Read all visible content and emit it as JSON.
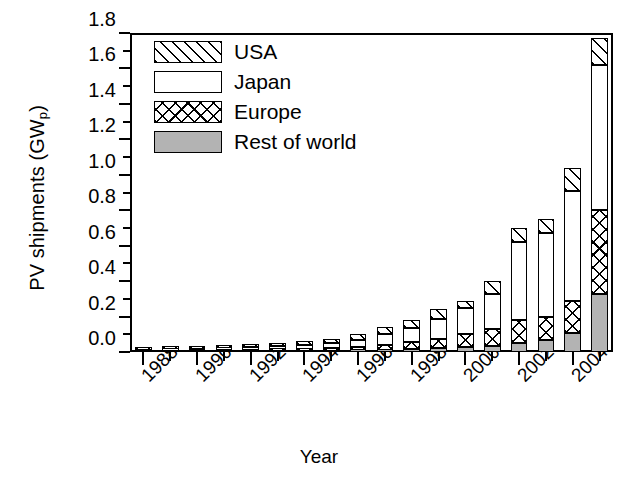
{
  "chart_data": {
    "type": "bar",
    "stacked": true,
    "title": "",
    "xlabel": "Year",
    "ylabel": "PV shipments (GW",
    "ylabel_sub": "p",
    "ylabel_suffix": ")",
    "ylim": [
      0.0,
      1.8
    ],
    "ytick_step": 0.2,
    "yticks": [
      "0.0",
      "0.2",
      "0.4",
      "0.6",
      "0.8",
      "1.0",
      "1.2",
      "1.4",
      "1.6",
      "1.8"
    ],
    "grid": false,
    "legend_position": "upper-left-inside",
    "categories": [
      "1988",
      "1989",
      "1990",
      "1991",
      "1992",
      "1993",
      "1994",
      "1995",
      "1996",
      "1997",
      "1998",
      "1999",
      "2000",
      "2001",
      "2002",
      "2003",
      "2004",
      "2005"
    ],
    "xtick_labels": [
      "1988",
      "1990",
      "1992",
      "1994",
      "1996",
      "1998",
      "2000",
      "2002",
      "2004"
    ],
    "xtick_label_indices": [
      0,
      2,
      4,
      6,
      8,
      10,
      12,
      14,
      16
    ],
    "series": [
      {
        "name": "Rest of world",
        "key": "row",
        "color": "#b3b3b3",
        "pattern": "solid-gray",
        "values": [
          0.002,
          0.003,
          0.004,
          0.004,
          0.005,
          0.006,
          0.007,
          0.008,
          0.01,
          0.013,
          0.016,
          0.02,
          0.027,
          0.035,
          0.05,
          0.07,
          0.11,
          0.33
        ]
      },
      {
        "name": "Europe",
        "key": "europe",
        "color": "#ffffff",
        "pattern": "cross-hatch",
        "values": [
          0.004,
          0.005,
          0.006,
          0.007,
          0.008,
          0.01,
          0.012,
          0.015,
          0.02,
          0.028,
          0.04,
          0.055,
          0.075,
          0.095,
          0.13,
          0.13,
          0.18,
          0.47
        ]
      },
      {
        "name": "Japan",
        "key": "japan",
        "color": "#ffffff",
        "pattern": "solid-white",
        "values": [
          0.006,
          0.007,
          0.009,
          0.011,
          0.013,
          0.016,
          0.021,
          0.027,
          0.04,
          0.06,
          0.08,
          0.11,
          0.145,
          0.2,
          0.44,
          0.47,
          0.62,
          0.82
        ]
      },
      {
        "name": "USA",
        "key": "usa",
        "color": "#ffffff",
        "pattern": "diagonal-hatch",
        "values": [
          0.008,
          0.01,
          0.011,
          0.013,
          0.014,
          0.018,
          0.02,
          0.025,
          0.03,
          0.039,
          0.044,
          0.055,
          0.043,
          0.07,
          0.08,
          0.08,
          0.13,
          0.15
        ]
      }
    ],
    "totals": [
      0.02,
      0.025,
      0.03,
      0.035,
      0.04,
      0.05,
      0.06,
      0.075,
      0.1,
      0.14,
      0.18,
      0.24,
      0.29,
      0.4,
      0.7,
      0.75,
      1.04,
      1.77
    ]
  },
  "legend": {
    "items": [
      {
        "label": "USA",
        "key": "usa"
      },
      {
        "label": "Japan",
        "key": "japan"
      },
      {
        "label": "Europe",
        "key": "europe"
      },
      {
        "label": "Rest of world",
        "key": "row"
      }
    ]
  }
}
